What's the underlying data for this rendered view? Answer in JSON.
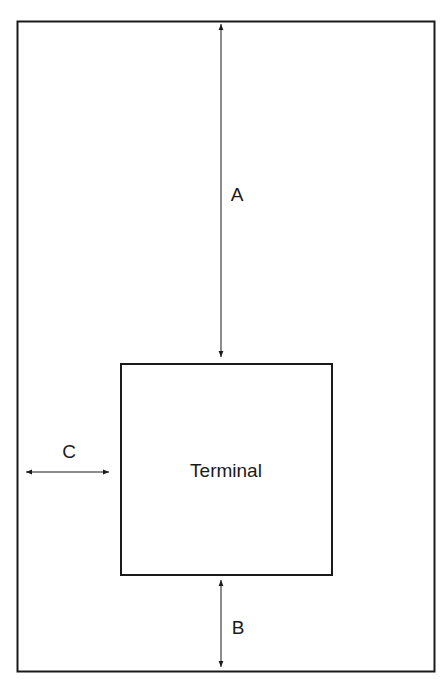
{
  "diagram": {
    "outer_area": {
      "label": ""
    },
    "terminal": {
      "label": "Terminal"
    },
    "dimensions": {
      "a": {
        "label": "A",
        "description": "distance from top edge of area to terminal"
      },
      "b": {
        "label": "B",
        "description": "distance from terminal to bottom edge of area"
      },
      "c": {
        "label": "C",
        "description": "distance from left edge of area to terminal"
      }
    },
    "colors": {
      "stroke": "#1a1a1a",
      "background": "#ffffff"
    }
  }
}
